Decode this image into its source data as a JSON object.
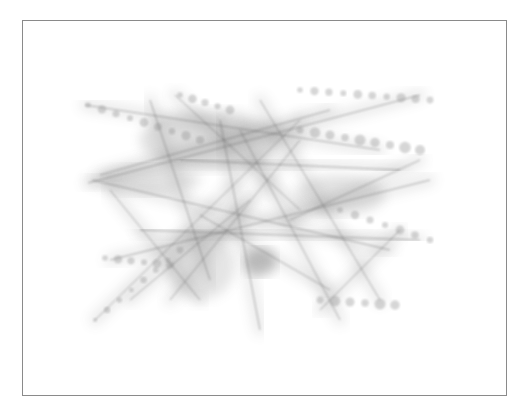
{
  "artwork": {
    "frame": {
      "x": 22,
      "y": 20,
      "width": 485,
      "height": 376,
      "border_color": "#8a8a8a"
    },
    "stroke_color": "#5a5a5a",
    "dot_color": "#8c8c8c",
    "blob_color": "#6e6e6e",
    "lines": [
      [
        88,
        183,
        420,
        95
      ],
      [
        92,
        180,
        390,
        250
      ],
      [
        100,
        175,
        330,
        110
      ],
      [
        85,
        105,
        380,
        150
      ],
      [
        175,
        95,
        300,
        210
      ],
      [
        150,
        100,
        210,
        280
      ],
      [
        110,
        260,
        430,
        180
      ],
      [
        95,
        320,
        300,
        120
      ],
      [
        130,
        300,
        250,
        200
      ],
      [
        200,
        215,
        330,
        290
      ],
      [
        240,
        130,
        340,
        320
      ],
      [
        290,
        220,
        420,
        160
      ],
      [
        320,
        310,
        400,
        230
      ],
      [
        300,
        100,
        440,
        100
      ],
      [
        180,
        160,
        400,
        170
      ],
      [
        140,
        230,
        420,
        240
      ],
      [
        170,
        300,
        300,
        140
      ],
      [
        260,
        100,
        380,
        300
      ],
      [
        110,
        190,
        200,
        300
      ],
      [
        220,
        120,
        260,
        330
      ]
    ],
    "dot_chains": [
      {
        "x1": 88,
        "y1": 105,
        "x2": 200,
        "y2": 140,
        "n": 9,
        "r": 4
      },
      {
        "x1": 300,
        "y1": 90,
        "x2": 430,
        "y2": 100,
        "n": 10,
        "r": 4
      },
      {
        "x1": 300,
        "y1": 130,
        "x2": 420,
        "y2": 150,
        "n": 9,
        "r": 5
      },
      {
        "x1": 105,
        "y1": 258,
        "x2": 170,
        "y2": 265,
        "n": 6,
        "r": 4
      },
      {
        "x1": 95,
        "y1": 320,
        "x2": 180,
        "y2": 250,
        "n": 8,
        "r": 3
      },
      {
        "x1": 320,
        "y1": 300,
        "x2": 395,
        "y2": 305,
        "n": 6,
        "r": 5
      },
      {
        "x1": 340,
        "y1": 210,
        "x2": 430,
        "y2": 240,
        "n": 7,
        "r": 4
      },
      {
        "x1": 180,
        "y1": 95,
        "x2": 230,
        "y2": 110,
        "n": 5,
        "r": 4
      }
    ],
    "blobs": [
      {
        "cx": 260,
        "cy": 262,
        "rx": 16,
        "ry": 14,
        "o": 0.45
      },
      {
        "cx": 210,
        "cy": 140,
        "rx": 70,
        "ry": 30,
        "o": 0.22
      },
      {
        "cx": 340,
        "cy": 195,
        "rx": 45,
        "ry": 20,
        "o": 0.2
      },
      {
        "cx": 200,
        "cy": 265,
        "rx": 35,
        "ry": 35,
        "o": 0.18
      },
      {
        "cx": 150,
        "cy": 180,
        "rx": 50,
        "ry": 15,
        "o": 0.2
      }
    ]
  }
}
